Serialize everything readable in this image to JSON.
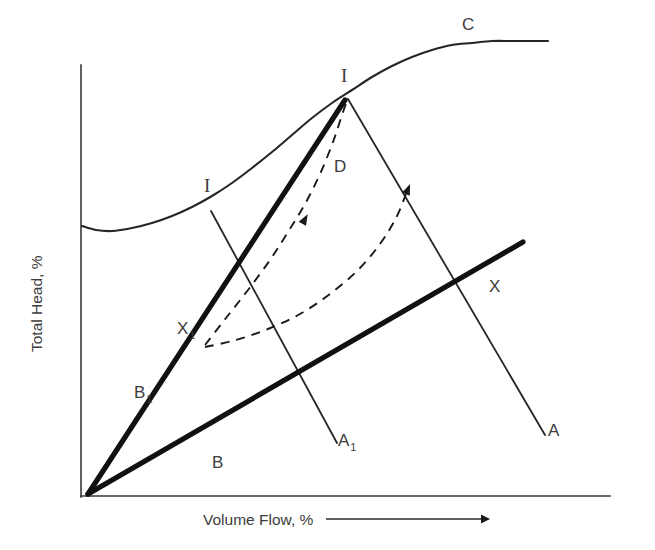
{
  "figure": {
    "background_color": "#ffffff",
    "line_color": "#262626",
    "text_color": "#3c3c3c"
  },
  "axes": {
    "y_title": "Total Head, %",
    "x_title": "Volume Flow, %",
    "x_arrow_icon": "right-arrow-icon",
    "origin": {
      "x": 87,
      "y": 496
    }
  },
  "chart_data": {
    "type": "line",
    "title": "",
    "xlabel": "Volume Flow, %",
    "ylabel": "Total Head, %",
    "grid": false,
    "legend": "none",
    "axis_ticks": "none",
    "xlim": [
      0,
      100
    ],
    "ylim": [
      0,
      100
    ],
    "series": [
      {
        "name": "C",
        "label": "C",
        "style": "solid-thin",
        "role": "machine-characteristic-curve",
        "points": [
          [
            82,
            226
          ],
          [
            96,
            230
          ],
          [
            112,
            231
          ],
          [
            132,
            228
          ],
          [
            152,
            223
          ],
          [
            172,
            216
          ],
          [
            192,
            207
          ],
          [
            212,
            196
          ],
          [
            232,
            183
          ],
          [
            252,
            168
          ],
          [
            272,
            152
          ],
          [
            292,
            135
          ],
          [
            312,
            118
          ],
          [
            332,
            103
          ],
          [
            352,
            90
          ],
          [
            372,
            77
          ],
          [
            392,
            66
          ],
          [
            412,
            57
          ],
          [
            432,
            50
          ],
          [
            452,
            45
          ],
          [
            472,
            43
          ],
          [
            492,
            41
          ],
          [
            512,
            41
          ],
          [
            532,
            41
          ],
          [
            548,
            41
          ]
        ]
      },
      {
        "name": "B1",
        "label": "B1",
        "style": "solid-thick",
        "role": "system-resistance-line-throttled",
        "points": [
          [
            88,
            494
          ],
          [
            345,
            100
          ]
        ]
      },
      {
        "name": "B",
        "label": "B",
        "style": "solid-thick",
        "role": "system-resistance-line-open",
        "points": [
          [
            88,
            494
          ],
          [
            523,
            242
          ]
        ]
      },
      {
        "name": "A1",
        "label": "A1",
        "style": "solid-thin",
        "role": "constant-speed-line-reduced",
        "points": [
          [
            211,
            211
          ],
          [
            337,
            443
          ]
        ]
      },
      {
        "name": "A",
        "label": "A",
        "style": "solid-thin",
        "role": "constant-speed-line",
        "points": [
          [
            348,
            99
          ],
          [
            545,
            435
          ]
        ]
      },
      {
        "name": "D-left",
        "label": "D",
        "style": "dashed",
        "role": "transition-path-upper",
        "arrow_at": [
          305,
          219
        ],
        "points": [
          [
            205,
            345
          ],
          [
            226,
            318
          ],
          [
            248,
            290
          ],
          [
            270,
            260
          ],
          [
            288,
            232
          ],
          [
            305,
            204
          ],
          [
            320,
            174
          ],
          [
            333,
            142
          ],
          [
            343,
            112
          ],
          [
            348,
            99
          ]
        ]
      },
      {
        "name": "D-right",
        "label": "",
        "style": "dashed",
        "role": "transition-path-lower",
        "arrow_at": [
          408,
          189
        ],
        "points": [
          [
            205,
            347
          ],
          [
            236,
            340
          ],
          [
            268,
            329
          ],
          [
            300,
            314
          ],
          [
            330,
            294
          ],
          [
            358,
            270
          ],
          [
            380,
            244
          ],
          [
            396,
            218
          ],
          [
            406,
            194
          ]
        ]
      },
      {
        "name": "I-left-tie",
        "label": "",
        "style": "solid-thin",
        "role": "surge-tie-line",
        "points": [
          [
            211,
            211
          ],
          [
            337,
            443
          ]
        ]
      }
    ],
    "annotations": [
      {
        "label": "C",
        "x": 462,
        "y": 30,
        "name": "label-c",
        "subscript": ""
      },
      {
        "label": "I",
        "x": 341,
        "y": 82,
        "name": "label-i-upper",
        "subscript": ""
      },
      {
        "label": "I",
        "x": 204,
        "y": 192,
        "name": "label-i-left",
        "subscript": ""
      },
      {
        "label": "D",
        "x": 334,
        "y": 172,
        "name": "label-d",
        "subscript": ""
      },
      {
        "label": "X",
        "x": 489,
        "y": 292,
        "name": "label-x",
        "subscript": ""
      },
      {
        "label": "X",
        "x": 177,
        "y": 334,
        "name": "label-x1",
        "subscript": "1"
      },
      {
        "label": "B",
        "x": 134,
        "y": 398,
        "name": "label-b1",
        "subscript": "1"
      },
      {
        "label": "B",
        "x": 212,
        "y": 468,
        "name": "label-b",
        "subscript": ""
      },
      {
        "label": "A",
        "x": 338,
        "y": 446,
        "name": "label-a1",
        "subscript": "1"
      },
      {
        "label": "A",
        "x": 548,
        "y": 436,
        "name": "label-a",
        "subscript": ""
      }
    ],
    "key_points": [
      {
        "name": "origin",
        "x": 88,
        "y": 494
      },
      {
        "name": "surge-point-I-top",
        "x": 348,
        "y": 99
      },
      {
        "name": "surge-point-I-left",
        "x": 211,
        "y": 211
      },
      {
        "name": "operating-point-X",
        "x": 472,
        "y": 284
      },
      {
        "name": "operating-point-X1",
        "x": 205,
        "y": 346
      }
    ]
  }
}
